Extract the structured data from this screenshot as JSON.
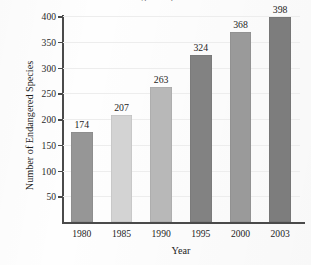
{
  "chart_data": {
    "type": "bar",
    "title": "Number of Endangered Species in the U.S.",
    "title_visibility": "cropped at top edge of image",
    "xlabel": "Year",
    "ylabel": "Number of Endangered Species",
    "categories": [
      "1980",
      "1985",
      "1990",
      "1995",
      "2000",
      "2003"
    ],
    "values": [
      174,
      207,
      263,
      324,
      368,
      398
    ],
    "value_labels": [
      "174",
      "207",
      "263",
      "324",
      "368",
      "398"
    ],
    "ylim": [
      0,
      400
    ],
    "ytick_values": [
      50,
      100,
      150,
      200,
      250,
      300,
      350,
      400
    ],
    "ytick_labels": [
      "50",
      "100",
      "150",
      "200",
      "250",
      "300",
      "350",
      "400"
    ],
    "grid": "horizontal, faint",
    "legend": "none",
    "bar_colors": [
      "#969696",
      "#d3d3d3",
      "#b8b8b8",
      "#828282",
      "#9a9a9a",
      "#7d7d7d"
    ],
    "axis_color": "#4a4a4a",
    "gridline_color": "#ededed",
    "text_color": "#1d1d1d",
    "background": "#fefefe"
  }
}
